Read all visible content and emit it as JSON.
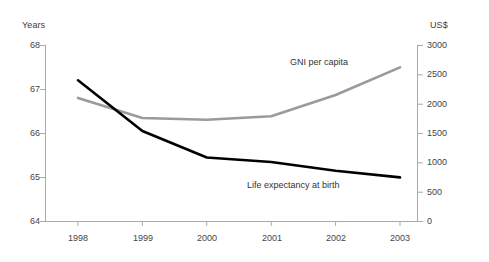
{
  "chart_data": {
    "type": "line",
    "title": "",
    "subtitle": "",
    "xlabel": "",
    "ylabel": "Years",
    "y2label": "US$",
    "categories": [
      "1998",
      "1999",
      "2000",
      "2001",
      "2002",
      "2003"
    ],
    "x": [
      1998,
      1999,
      2000,
      2001,
      2002,
      2003
    ],
    "grid": false,
    "legend_position": "inline-annotation",
    "axes": {
      "left": {
        "label": "Years",
        "ticks": [
          "68",
          "67",
          "66",
          "65",
          "64"
        ],
        "tick_values": [
          68,
          67,
          66,
          65,
          64
        ],
        "ylim": [
          64,
          68
        ]
      },
      "right": {
        "label": "US$",
        "ticks": [
          "3000",
          "2500",
          "2000",
          "1500",
          "1000",
          "500",
          "0"
        ],
        "tick_values": [
          3000,
          2500,
          2000,
          1500,
          1000,
          500,
          0
        ],
        "ylim": [
          0,
          3000
        ]
      }
    },
    "series": [
      {
        "name": "Life expectancy at birth",
        "axis": "left",
        "color": "#000000",
        "unit": "years",
        "values": [
          67.2,
          66.05,
          65.45,
          65.35,
          65.15,
          65.0
        ]
      },
      {
        "name": "GNI per capita",
        "axis": "right",
        "color": "#9a9a9a",
        "unit": "US$",
        "values": [
          2100,
          1760,
          1730,
          1790,
          2150,
          2620
        ]
      }
    ],
    "annotations": [
      {
        "text": "GNI per capita",
        "series": "GNI per capita"
      },
      {
        "text": "Life expectancy at birth",
        "series": "Life expectancy at birth"
      }
    ]
  },
  "colors": {
    "background": "#ffffff",
    "axis": "#a9a9a9",
    "text": "#3c3c3c",
    "life_expectancy_line": "#000000",
    "gni_line": "#9a9a9a"
  }
}
